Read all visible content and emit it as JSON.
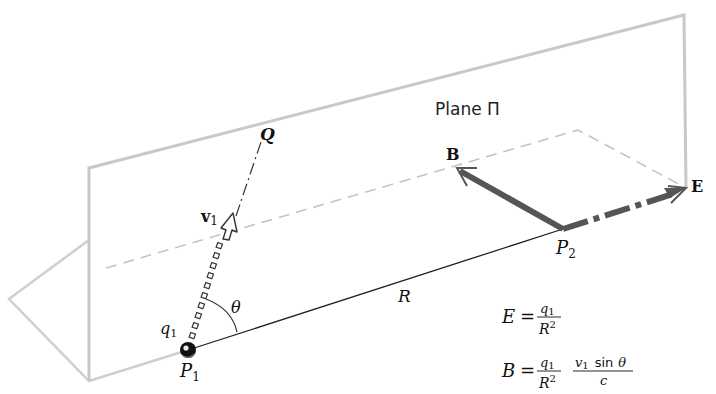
{
  "figure": {
    "plane_label": "Plane Π",
    "labels": {
      "Q": "Q",
      "v1_main": "v",
      "v1_sub": "1",
      "q1_main": "q",
      "q1_sub": "1",
      "P1_main": "P",
      "P1_sub": "1",
      "P2_main": "P",
      "P2_sub": "2",
      "theta": "θ",
      "R": "R",
      "B": "B",
      "E": "E"
    },
    "equations": {
      "E_lhs": "E",
      "E_eq": "=",
      "E_num_main": "q",
      "E_num_sub": "1",
      "E_den_main": "R",
      "E_den_sup": "2",
      "B_lhs": "B",
      "B_eq": "=",
      "B_num_main": "q",
      "B_num_sub": "1",
      "B_den_main": "R",
      "B_den_sup": "2",
      "B_frac2_num_v": "v",
      "B_frac2_num_sub": "1",
      "B_frac2_num_sin": "sin",
      "B_frac2_num_theta": "θ",
      "B_frac2_den": "c"
    },
    "colors": {
      "plane_edge": "#c8c8c8",
      "dashed": "#c0c0c0",
      "vector": "#555555",
      "line": "#222222"
    }
  }
}
